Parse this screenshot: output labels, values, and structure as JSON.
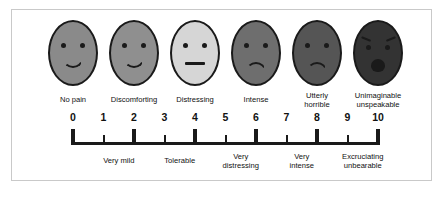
{
  "frame": {
    "border_color": "#c9c9c9",
    "background": "#ffffff"
  },
  "ink_color": "#1a1a1a",
  "scale": {
    "min": 0,
    "max": 10,
    "numbers": [
      "0",
      "1",
      "2",
      "3",
      "4",
      "5",
      "6",
      "7",
      "8",
      "9",
      "10"
    ],
    "major_ticks": [
      0,
      2,
      4,
      6,
      8,
      10
    ],
    "minor_ticks": [
      1,
      3,
      5,
      7,
      9
    ]
  },
  "faces": [
    {
      "name": "no-pain",
      "label": "No pain",
      "expression": "smile",
      "fill": "#8a8a8a",
      "value": 0
    },
    {
      "name": "discomforting",
      "label": "Discomforting",
      "expression": "smile",
      "fill": "#8f8f8f",
      "value": 2
    },
    {
      "name": "distressing",
      "label": "Distressing",
      "expression": "neutral",
      "fill": "#d6d6d6",
      "value": 4
    },
    {
      "name": "intense",
      "label": "Intense",
      "expression": "frown",
      "fill": "#6e6e6e",
      "value": 6
    },
    {
      "name": "utterly-horrible",
      "label": "Utterly\nhorrible",
      "expression": "frown",
      "fill": "#555555",
      "value": 8
    },
    {
      "name": "unimaginable",
      "label": "Unimaginable\nunspeakable",
      "expression": "wail",
      "fill": "#333333",
      "value": 10
    }
  ],
  "descriptors": [
    {
      "name": "very-mild",
      "label": "Very mild",
      "range": [
        1,
        2
      ]
    },
    {
      "name": "tolerable",
      "label": "Tolerable",
      "range": [
        3,
        4
      ]
    },
    {
      "name": "very-distressing",
      "label": "Very\ndistressing",
      "range": [
        5,
        6
      ]
    },
    {
      "name": "very-intense",
      "label": "Very\nintense",
      "range": [
        7,
        8
      ]
    },
    {
      "name": "excruciating-unbearable",
      "label": "Excruciating\nunbearable",
      "range": [
        9,
        10
      ]
    }
  ]
}
